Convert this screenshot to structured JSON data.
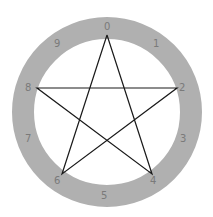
{
  "diagram": {
    "title": "",
    "center": {
      "x": 107,
      "y": 112
    },
    "ring": {
      "outer_radius": 95,
      "inner_radius": 73,
      "color": "#b0b0b0"
    },
    "line_color": "#1a1a1a",
    "label_color": "#7a7a7a",
    "labels": [
      "0",
      "1",
      "2",
      "3",
      "4",
      "5",
      "6",
      "7",
      "8",
      "9"
    ],
    "star_order": [
      "0",
      "4",
      "8",
      "2",
      "6",
      "0"
    ]
  }
}
